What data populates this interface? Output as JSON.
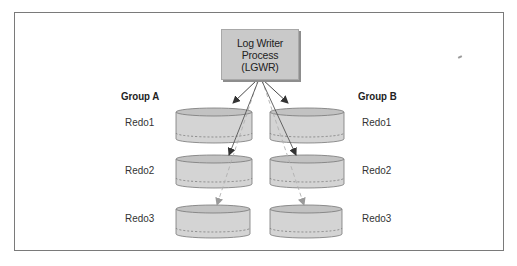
{
  "process": {
    "line1": "Log Writer",
    "line2": "Process",
    "line3": "(LGWR)"
  },
  "groups": [
    {
      "label": "Group A",
      "members": [
        "Redo1",
        "Redo2",
        "Redo3"
      ]
    },
    {
      "label": "Group B",
      "members": [
        "Redo1",
        "Redo2",
        "Redo3"
      ]
    }
  ],
  "colors": {
    "frame": "#7a7a7a",
    "process_fill": "#c9c9c9",
    "process_shadow": "#8d8d8d",
    "cylinder_fill": "#d4d4d4",
    "cylinder_stroke": "#777777",
    "arrow_active": "#333333",
    "arrow_inactive": "#aaaaaa"
  }
}
